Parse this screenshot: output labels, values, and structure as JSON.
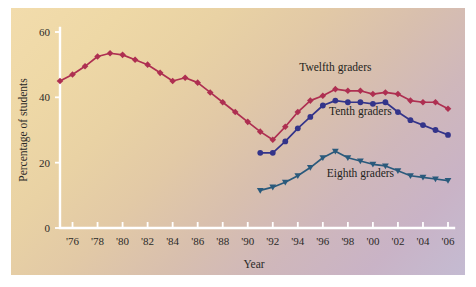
{
  "chart_data": {
    "type": "line",
    "title": "",
    "xlabel": "Year",
    "ylabel": "Percentage of students",
    "xlim": [
      1975,
      2006
    ],
    "ylim": [
      0,
      60
    ],
    "grid": false,
    "legend_position": "inline-annotations",
    "y_ticks": [
      "0",
      "20",
      "40",
      "60"
    ],
    "y_tick_values": [
      0,
      20,
      40,
      60
    ],
    "x_ticks": [
      "'76",
      "'78",
      "'80",
      "'82",
      "'84",
      "'86",
      "'88",
      "'90",
      "'92",
      "'94",
      "'96",
      "'98",
      "'00",
      "'02",
      "'04",
      "'06"
    ],
    "x_tick_values": [
      1976,
      1978,
      1980,
      1982,
      1984,
      1986,
      1988,
      1990,
      1992,
      1994,
      1996,
      1998,
      2000,
      2002,
      2004,
      2006
    ],
    "series": [
      {
        "name": "Twelfth graders",
        "color": "#ae2f51",
        "marker": "diamond",
        "x": [
          1975,
          1976,
          1977,
          1978,
          1979,
          1980,
          1981,
          1982,
          1983,
          1984,
          1985,
          1986,
          1987,
          1988,
          1989,
          1990,
          1991,
          1992,
          1993,
          1994,
          1995,
          1996,
          1997,
          1998,
          1999,
          2000,
          2001,
          2002,
          2003,
          2004,
          2005,
          2006
        ],
        "values": [
          45.0,
          47.0,
          49.5,
          52.5,
          53.5,
          53.0,
          51.5,
          50.0,
          47.5,
          45.0,
          46.0,
          44.5,
          41.5,
          38.5,
          35.5,
          32.5,
          29.5,
          27.0,
          31.0,
          35.5,
          39.0,
          40.5,
          42.5,
          42.0,
          42.0,
          41.0,
          41.5,
          41.0,
          39.0,
          38.5,
          38.5,
          36.5
        ]
      },
      {
        "name": "Tenth graders",
        "color": "#33348a",
        "marker": "circle",
        "x": [
          1991,
          1992,
          1993,
          1994,
          1995,
          1996,
          1997,
          1998,
          1999,
          2000,
          2001,
          2002,
          2003,
          2004,
          2005,
          2006
        ],
        "values": [
          23.0,
          23.0,
          26.5,
          30.5,
          34.0,
          37.5,
          39.0,
          38.5,
          38.5,
          38.0,
          38.5,
          35.5,
          33.0,
          31.5,
          30.0,
          28.5
        ]
      },
      {
        "name": "Eighth graders",
        "color": "#2a5a7c",
        "marker": "triangle",
        "x": [
          1991,
          1992,
          1993,
          1994,
          1995,
          1996,
          1997,
          1998,
          1999,
          2000,
          2001,
          2002,
          2003,
          2004,
          2005,
          2006
        ],
        "values": [
          11.5,
          12.5,
          14.0,
          16.0,
          18.5,
          21.5,
          23.5,
          21.5,
          20.5,
          19.5,
          19.0,
          17.5,
          16.0,
          15.5,
          15.0,
          14.5
        ]
      }
    ],
    "annotations": [
      {
        "text": "Twelfth graders",
        "x": 1997.0,
        "y": 48.0
      },
      {
        "text": "Tenth graders",
        "x": 1999.0,
        "y": 34.5
      },
      {
        "text": "Eighth graders",
        "x": 1999.0,
        "y": 15.5
      }
    ]
  }
}
